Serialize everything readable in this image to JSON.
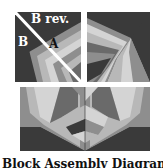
{
  "diagram": {
    "labels": {
      "b_rev": "B rev.",
      "b": "B",
      "a": "A"
    },
    "caption": "Block Assembly Diagram",
    "colors": {
      "dark": "#3a3a3a",
      "mid_dark": "#6a6a6a",
      "mid": "#8e8e8e",
      "light": "#b8b8b8",
      "lighter": "#d4d4d4",
      "white": "#ffffff"
    }
  }
}
